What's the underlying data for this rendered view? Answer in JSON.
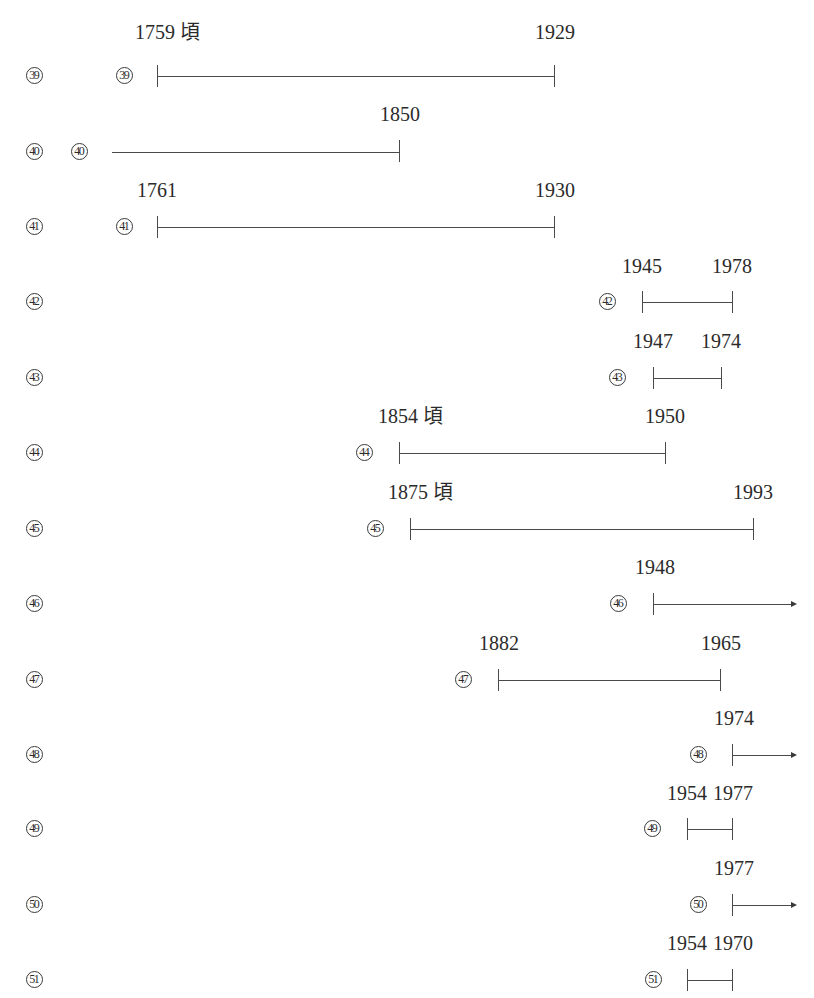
{
  "colors": {
    "text": "#2b2b2b",
    "line": "#4a4a4a",
    "background": "#ffffff"
  },
  "rows": [
    {
      "id": "39",
      "circled": "39",
      "start_label": "1759 頃",
      "end_label": "1929",
      "start_open": false,
      "end_arrow": false
    },
    {
      "id": "40",
      "circled": "40",
      "start_label": "",
      "end_label": "1850",
      "start_open": true,
      "end_arrow": false
    },
    {
      "id": "41",
      "circled": "41",
      "start_label": "1761",
      "end_label": "1930",
      "start_open": false,
      "end_arrow": false
    },
    {
      "id": "42",
      "circled": "42",
      "start_label": "1945",
      "end_label": "1978",
      "start_open": false,
      "end_arrow": false
    },
    {
      "id": "43",
      "circled": "43",
      "start_label": "1947",
      "end_label": "1974",
      "start_open": false,
      "end_arrow": false
    },
    {
      "id": "44",
      "circled": "44",
      "start_label": "1854 頃",
      "end_label": "1950",
      "start_open": false,
      "end_arrow": false
    },
    {
      "id": "45",
      "circled": "45",
      "start_label": "1875 頃",
      "end_label": "1993",
      "start_open": false,
      "end_arrow": false
    },
    {
      "id": "46",
      "circled": "46",
      "start_label": "1948",
      "end_label": "",
      "start_open": false,
      "end_arrow": true
    },
    {
      "id": "47",
      "circled": "47",
      "start_label": "1882",
      "end_label": "1965",
      "start_open": false,
      "end_arrow": false
    },
    {
      "id": "48",
      "circled": "48",
      "start_label": "1974",
      "end_label": "",
      "start_open": false,
      "end_arrow": true
    },
    {
      "id": "49",
      "circled": "49",
      "start_label": "1954",
      "end_label": "1977",
      "start_open": false,
      "end_arrow": false
    },
    {
      "id": "50",
      "circled": "50",
      "start_label": "1977",
      "end_label": "",
      "start_open": false,
      "end_arrow": true
    },
    {
      "id": "51",
      "circled": "51",
      "start_label": "1954",
      "end_label": "1970",
      "start_open": false,
      "end_arrow": false
    }
  ]
}
